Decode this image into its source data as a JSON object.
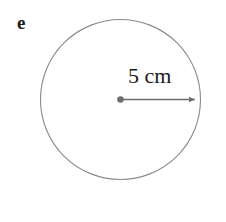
{
  "figure": {
    "part_label": "e",
    "shape": "circle",
    "measurement_label": "5 cm",
    "colors": {
      "background": "#ffffff",
      "circle_stroke": "#8a8a8a",
      "arrow": "#6e6e6e",
      "center_dot": "#6e6e6e",
      "text": "#1c1c1c",
      "part_label_text": "#1a1a1a"
    },
    "geometry": {
      "center_x": 120.5,
      "center_y": 99.5,
      "radius_px": 80,
      "radius_value": 5,
      "radius_unit": "cm",
      "arrow_start_x": 120.5,
      "arrow_end_x": 202,
      "arrow_y": 99.5,
      "circle_stroke_width": 1
    }
  }
}
